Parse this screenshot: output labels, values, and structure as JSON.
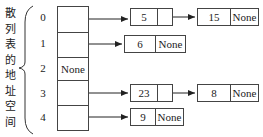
{
  "label": "散列表的地址空间",
  "slots": [
    {
      "index": "0",
      "value": "",
      "chain": [
        {
          "value": "5",
          "next": ""
        },
        {
          "value": "15",
          "next": "None"
        }
      ]
    },
    {
      "index": "1",
      "value": "",
      "chain": [
        {
          "value": "6",
          "next": "None"
        }
      ]
    },
    {
      "index": "2",
      "value": "None",
      "chain": []
    },
    {
      "index": "3",
      "value": "",
      "chain": [
        {
          "value": "23",
          "next": ""
        },
        {
          "value": "8",
          "next": "None"
        }
      ]
    },
    {
      "index": "4",
      "value": "",
      "chain": [
        {
          "value": "9",
          "next": "None"
        }
      ]
    }
  ]
}
